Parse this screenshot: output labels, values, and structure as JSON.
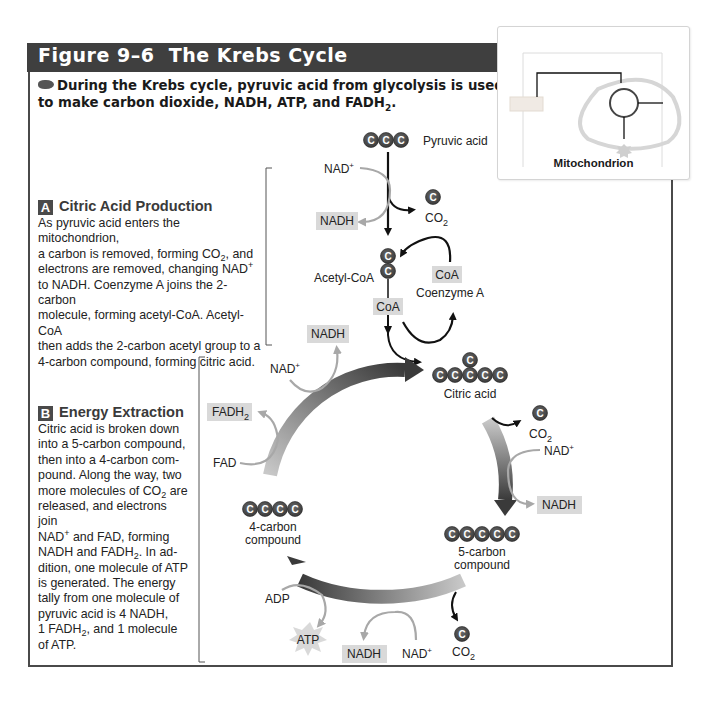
{
  "figure": {
    "number_label": "Figure 9–6",
    "title": "The Krebs Cycle",
    "intro_text": "During the Krebs cycle, pyruvic acid from glycolysis is used to make carbon dioxide, NADH, ATP, and FADH",
    "intro_sub": "2",
    "intro_end": "."
  },
  "colors": {
    "header_band": "#3f3f3f",
    "carbon_ball": "#4d4d4d",
    "label_box": "#d9d9d9",
    "gray_arrow": "#a8a8a8",
    "cycle_dark": "#3a3a3a",
    "cycle_light": "#c8c8c8"
  },
  "section_a": {
    "badge": "A",
    "heading": "Citric Acid Production",
    "lines": [
      "As pyruvic acid enters the mitochondrion,",
      "a carbon is removed, forming CO",
      "electrons are removed, changing NAD",
      "to NADH. Coenzyme A joins the 2-carbon",
      "molecule, forming acetyl-CoA. Acetyl-CoA",
      "then adds the 2-carbon acetyl group to a",
      "4-carbon compound, forming citric acid."
    ],
    "line2_sub": "2",
    "line2_tail": ", and",
    "line3_sup": "+"
  },
  "section_b": {
    "badge": "B",
    "heading": "Energy Extraction",
    "lines": [
      "Citric acid is broken down",
      "into a 5-carbon compound,",
      "then into a 4-carbon com-",
      "pound. Along the way, two",
      "more molecules of CO",
      "released, and electrons join",
      "NAD",
      "NADH and FADH",
      "dition, one molecule of ATP",
      "is generated. The energy",
      "tally from one molecule of",
      "pyruvic acid is 4 NADH,",
      "1 FADH",
      "of ATP."
    ],
    "line5_sub": "2",
    "line5_tail": " are",
    "line7_sup": "+",
    "line7_tail": " and FAD, forming",
    "line8_sub": "2",
    "line8_tail": ". In ad-",
    "line13_sub": "2",
    "line13_tail": ", and 1 molecule"
  },
  "inset": {
    "label": "Mitochondrion"
  },
  "diagram": {
    "carbon_glyph": "C",
    "pyruvic_acid": "Pyruvic acid",
    "nad_plus": "NAD",
    "plus": "+",
    "nadh": "NADH",
    "co2": "CO",
    "co2_sub": "2",
    "acetyl_coa": "Acetyl-CoA",
    "coa": "CoA",
    "coenzyme_a": "Coenzyme A",
    "citric_acid": "Citric acid",
    "five_carbon_1": "5-carbon",
    "five_carbon_2": "compound",
    "four_carbon_1": "4-carbon",
    "four_carbon_2": "compound",
    "fadh": "FADH",
    "fadh_sub": "2",
    "fad": "FAD",
    "adp": "ADP",
    "atp": "ATP"
  }
}
